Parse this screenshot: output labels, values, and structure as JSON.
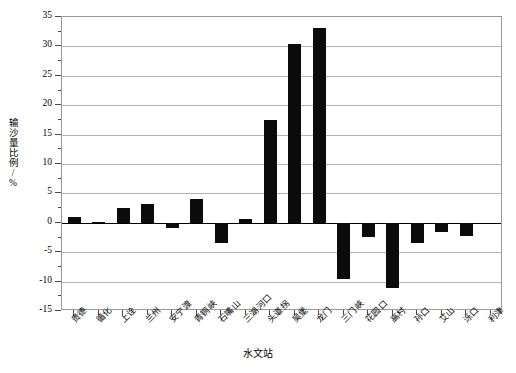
{
  "chart_data": {
    "type": "bar",
    "title": "",
    "xlabel": "水文站",
    "ylabel": "输沙量比例/%",
    "ylim": [
      -15,
      35
    ],
    "ytick_step": 5,
    "yticks": [
      -15,
      -10,
      -5,
      0,
      5,
      10,
      15,
      20,
      25,
      30,
      35
    ],
    "ytick_labels": [
      "-15",
      "-10",
      "-5",
      "0",
      "5",
      "10",
      "15",
      "20",
      "25",
      "30",
      "35"
    ],
    "grid": true,
    "legend": false,
    "bar_color": "#0b0b0b",
    "categories": [
      "贵德",
      "循化",
      "上诠",
      "兰州",
      "安宁渡",
      "青铜峡",
      "石嘴山",
      "三湖河口",
      "头道拐",
      "吴堡",
      "龙门",
      "三门峡",
      "花园口",
      "高村",
      "孙口",
      "艾山",
      "泺口",
      "利津"
    ],
    "values": [
      1.0,
      0.2,
      2.6,
      3.2,
      -0.8,
      4.0,
      -3.4,
      0.7,
      17.5,
      30.4,
      33.2,
      -9.5,
      -2.4,
      -11.1,
      -3.4,
      -1.6,
      -2.3,
      0
    ],
    "series": [
      {
        "name": "输沙量比例",
        "points": [
          {
            "category": "贵德",
            "value": 1.0
          },
          {
            "category": "循化",
            "value": 0.2
          },
          {
            "category": "上诠",
            "value": 2.6
          },
          {
            "category": "兰州",
            "value": 3.2
          },
          {
            "category": "安宁渡",
            "value": -0.8
          },
          {
            "category": "青铜峡",
            "value": 4.0
          },
          {
            "category": "石嘴山",
            "value": -3.4
          },
          {
            "category": "三湖河口",
            "value": 0.7
          },
          {
            "category": "头道拐",
            "value": 17.5
          },
          {
            "category": "吴堡",
            "value": 30.4
          },
          {
            "category": "龙门",
            "value": 33.2
          },
          {
            "category": "三门峡",
            "value": -9.5
          },
          {
            "category": "花园口",
            "value": -2.4
          },
          {
            "category": "高村",
            "value": -11.1
          },
          {
            "category": "孙口",
            "value": -3.4
          },
          {
            "category": "艾山",
            "value": -1.6
          },
          {
            "category": "泺口",
            "value": -2.3
          },
          {
            "category": "利津",
            "value": -2.4
          }
        ]
      }
    ]
  }
}
